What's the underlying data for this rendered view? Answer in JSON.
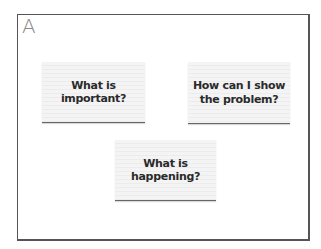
{
  "panel": {
    "label": "A"
  },
  "cards": [
    {
      "text": "What is important?"
    },
    {
      "text": "How can I show the problem?"
    },
    {
      "text": "What is happening?"
    }
  ],
  "colors": {
    "frame": "#555555",
    "label": "#8a8a8a",
    "card_bg": "#f2f2f2",
    "text": "#2a2a2a"
  }
}
